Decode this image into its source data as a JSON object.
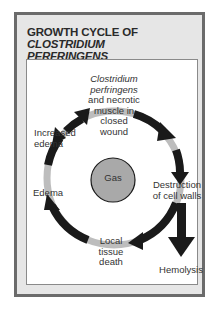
{
  "title": {
    "prefix": "GROWTH CYCLE OF ",
    "italic_1": "CLOSTRIDIUM",
    "italic_2": "PERFRINGENS"
  },
  "center": {
    "label": "Gas",
    "color": "#a9a9a9"
  },
  "stages": [
    {
      "id": "start",
      "line1": "Clostridium",
      "line2": "perfringens",
      "line3": "and necrotic",
      "line4": "muscle in",
      "line5": "closed",
      "line6": "wound"
    },
    {
      "id": "destruction",
      "line1": "Destruction",
      "line2": "of cell walls"
    },
    {
      "id": "tissue-death",
      "line1": "Local",
      "line2": "tissue",
      "line3": "death"
    },
    {
      "id": "edema",
      "line1": "Edema"
    },
    {
      "id": "increased-edema",
      "line1": "Increased",
      "line2": "edema"
    }
  ],
  "branch": {
    "label": "Hemolysis"
  },
  "colors": {
    "arrow": "#1a1a1a",
    "ring": "#bdbdbd",
    "frame": "#6b6b6b",
    "background": "#e6e6e6"
  }
}
